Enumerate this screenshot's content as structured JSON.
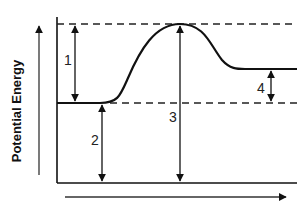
{
  "diagram": {
    "type": "energy-profile",
    "y_axis_label": "Potential Energy",
    "x_axis_label": "",
    "labels": {
      "arrow1": "1",
      "arrow2": "2",
      "arrow3": "3",
      "arrow4": "4"
    },
    "levels": {
      "transition_state": "top dashed line",
      "reactants": "lower baseline",
      "products": "right plateau"
    },
    "colors": {
      "line": "#111111",
      "background": "#ffffff"
    }
  }
}
